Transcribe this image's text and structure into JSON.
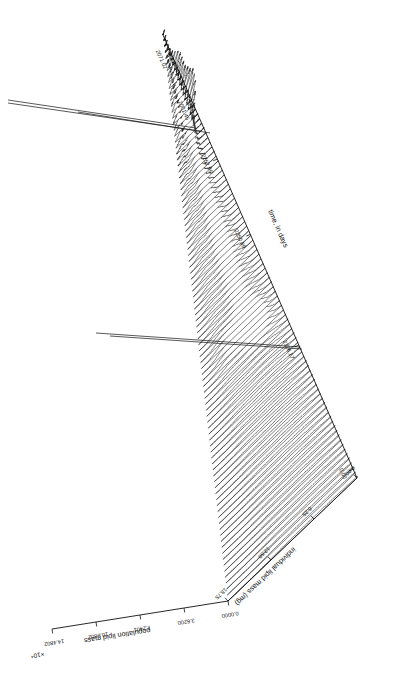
{
  "figure": {
    "kind": "waterfall-3d-surface",
    "orientation": "rotated-180",
    "background_color": "#ffffff",
    "line_color": "#111111"
  },
  "chart_data": {
    "type": "line",
    "title": "",
    "subtitle": "",
    "style": "3D waterfall / ridgeline surface of population lipid mass distributions over time",
    "orientation_note": "Entire figure including all text is rendered rotated 180 degrees (upside down)",
    "grid": false,
    "legend": null,
    "axes": {
      "x": {
        "label": "individual lipid mass (mg)",
        "ticks": [
          "0.00",
          "6.25",
          "12.50",
          "18.75"
        ],
        "values": [
          0.0,
          6.25,
          12.5,
          18.75
        ],
        "lim": [
          0.0,
          18.75
        ]
      },
      "y": {
        "label": "time, in days",
        "ticks": [
          "0.00",
          "2126.17",
          "2250.89",
          "2252.95",
          "2001.45",
          "2071.02"
        ],
        "values": [
          0.0,
          2126.17,
          2250.89,
          2252.95,
          2001.45,
          2071.02
        ],
        "lim": [
          0.0,
          2252.95
        ]
      },
      "z": {
        "label": "population lipid mass",
        "ticks": [
          "0.0000",
          "3.6200",
          "7.2401",
          "10.8602",
          "14.4802"
        ],
        "values": [
          0.0,
          3.62,
          7.2401,
          10.8602,
          14.4802
        ],
        "exponent": "×10⁴",
        "lim": [
          0.0,
          14.4802
        ]
      }
    },
    "series_count": 96
  },
  "labels": {
    "x_axis_title": "individual lipid mass (mg)",
    "y_axis_title": "time, in days",
    "z_axis_title": "population lipid mass",
    "z_exponent": "×10⁴",
    "x_ticks": [
      "0.00",
      "6.25",
      "12.50",
      "18.75"
    ],
    "y_ticks": [
      "0.00",
      "2126.17",
      "2250.89",
      "2252.95",
      "2001.45",
      "2071.02"
    ],
    "z_ticks": [
      "0.0000",
      "3.6200",
      "7.2401",
      "10.8602",
      "14.4802"
    ]
  }
}
